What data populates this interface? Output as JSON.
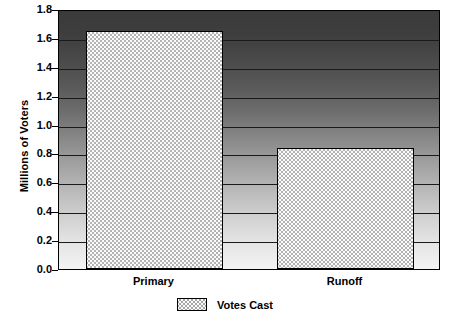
{
  "chart_data": {
    "type": "bar",
    "title": "",
    "xlabel": "",
    "ylabel": "Millions of Voters",
    "categories": [
      "Primary",
      "Runoff"
    ],
    "values": [
      1.65,
      0.84
    ],
    "series": [
      {
        "name": "Votes Cast",
        "values": [
          1.65,
          0.84
        ]
      }
    ],
    "ylim": [
      0.0,
      1.8
    ],
    "ytick_labels": [
      "0.0",
      "0.2",
      "0.4",
      "0.6",
      "0.8",
      "1.0",
      "1.2",
      "1.4",
      "1.6",
      "1.8"
    ],
    "ytick_values": [
      0.0,
      0.2,
      0.4,
      0.6,
      0.8,
      1.0,
      1.2,
      1.4,
      1.6,
      1.8
    ],
    "grid": true,
    "legend_position": "bottom-center",
    "legend_entries": [
      "Votes Cast"
    ],
    "plot_background": "vertical gradient dark-gray to light-gray",
    "bar_fill": "crosshatch pattern",
    "colors": {
      "axis": "#000000",
      "gridline": "#1a1a1a",
      "bar_outline": "#000000",
      "bar_fill_base": "#fbfbfb",
      "plot_bg_top": "#3a3a3a",
      "plot_bg_bottom": "#f4f4f4"
    }
  },
  "legend": {
    "swatch_name": "votes-cast-swatch",
    "label": "Votes Cast"
  }
}
